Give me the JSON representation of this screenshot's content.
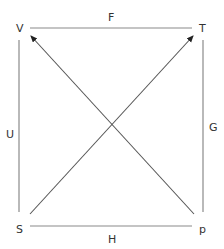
{
  "diagram": {
    "type": "commutative-square-with-diagonals",
    "nodes": [
      {
        "id": "V",
        "label": "V",
        "position": "top-left"
      },
      {
        "id": "T",
        "label": "T",
        "position": "top-right"
      },
      {
        "id": "S",
        "label": "S",
        "position": "bottom-left"
      },
      {
        "id": "p",
        "label": "p",
        "position": "bottom-right"
      }
    ],
    "edges": [
      {
        "id": "F",
        "label": "F",
        "from": "V",
        "to": "T",
        "side": "top",
        "arrow": false
      },
      {
        "id": "H",
        "label": "H",
        "from": "S",
        "to": "p",
        "side": "bottom",
        "arrow": false
      },
      {
        "id": "U",
        "label": "U",
        "from": "V",
        "to": "S",
        "side": "left",
        "arrow": false
      },
      {
        "id": "G",
        "label": "G",
        "from": "T",
        "to": "p",
        "side": "right",
        "arrow": false
      },
      {
        "id": "diag1",
        "label": "",
        "from": "p",
        "to": "V",
        "arrow": true
      },
      {
        "id": "diag2",
        "label": "",
        "from": "S",
        "to": "T",
        "arrow": true
      }
    ],
    "colors": {
      "edge": "#8a8a8a",
      "diagonal": "#555555",
      "text": "#333333"
    }
  }
}
